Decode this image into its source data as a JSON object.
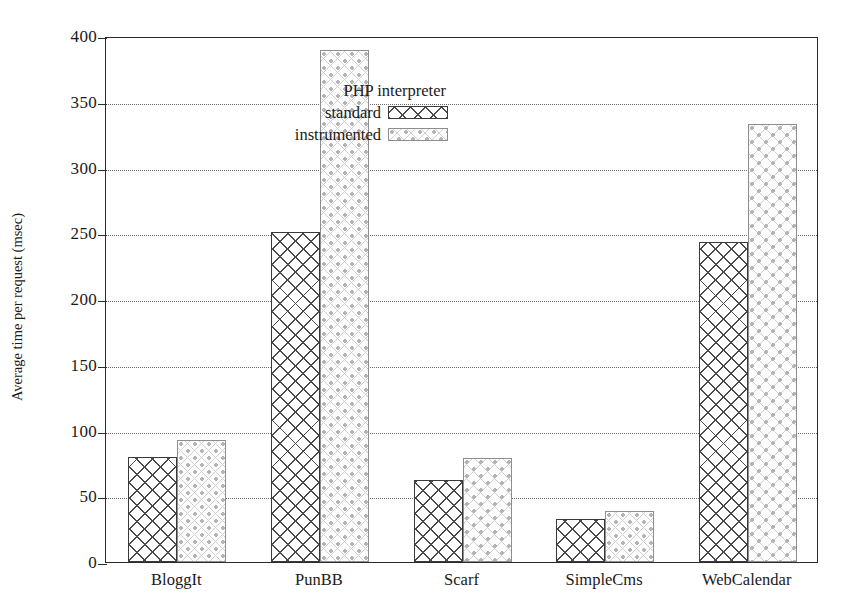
{
  "chart_data": {
    "type": "bar",
    "title": "",
    "xlabel": "",
    "ylabel": "Average time per request (msec)",
    "categories": [
      "BloggIt",
      "PunBB",
      "Scarf",
      "SimpleCms",
      "WebCalendar"
    ],
    "series": [
      {
        "name": "standard",
        "values": [
          80,
          251,
          62,
          33,
          243
        ]
      },
      {
        "name": "instrumented",
        "values": [
          93,
          389,
          79,
          39,
          333
        ]
      }
    ],
    "ylim": [
      0,
      400
    ],
    "yticks": [
      0,
      50,
      100,
      150,
      200,
      250,
      300,
      350,
      400
    ],
    "ytick_labels": [
      "0",
      "50",
      "100",
      "150",
      "200",
      "250",
      "300",
      "350",
      "400"
    ],
    "gridlines": [
      50,
      100,
      150,
      200,
      250,
      300,
      350
    ],
    "grid": true,
    "legend": {
      "title": "PHP interpreter",
      "position": "top-left-inside",
      "entries": [
        {
          "label": "standard",
          "pattern": "cross-hatch-dark"
        },
        {
          "label": "instrumented",
          "pattern": "dotted-circles-light"
        }
      ]
    },
    "colors": {
      "axis": "#2b2b2b",
      "grid": "#6a6a6a",
      "standard": "#4a4a4a",
      "instrumented": "#b4b4b4",
      "background": "#ffffff"
    }
  }
}
